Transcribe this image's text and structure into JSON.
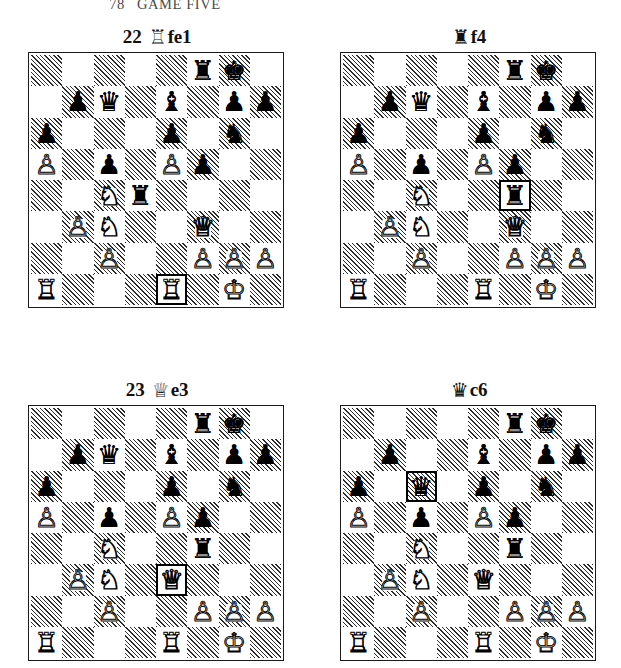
{
  "running_head": {
    "folio": "78",
    "title": "GAME FIVE"
  },
  "glyphs": {
    "white_king": "♔",
    "white_queen": "♕",
    "white_rook": "♖",
    "white_bishop": "♗",
    "white_knight": "♘",
    "white_pawn": "♙",
    "black_king": "♚",
    "black_queen": "♛",
    "black_rook": "♜",
    "black_bishop": "♝",
    "black_knight": "♞",
    "black_pawn": "♟"
  },
  "colors": {
    "ink": "#111111",
    "board_border": "#1a1a1a",
    "hatch": "#2b2b2b",
    "highlight": "#000000",
    "page": "#ffffff"
  },
  "diagrams": [
    {
      "id": "diagram-1",
      "position_label": "top-left",
      "caption": {
        "move_number": "22",
        "piece_glyph": "♖",
        "piece_name": "white-rook",
        "san": "fe1",
        "full": "22 ♖fe1"
      },
      "highlight_square": "e1",
      "pieces": [
        {
          "square": "f8",
          "piece": "black-rook",
          "glyph": "♜",
          "side": "b"
        },
        {
          "square": "g8",
          "piece": "black-king",
          "glyph": "♚",
          "side": "b"
        },
        {
          "square": "b7",
          "piece": "black-pawn",
          "glyph": "♟",
          "side": "b"
        },
        {
          "square": "c7",
          "piece": "black-queen",
          "glyph": "♛",
          "side": "b"
        },
        {
          "square": "e7",
          "piece": "black-bishop",
          "glyph": "♝",
          "side": "b"
        },
        {
          "square": "g7",
          "piece": "black-pawn",
          "glyph": "♟",
          "side": "b"
        },
        {
          "square": "h7",
          "piece": "black-pawn",
          "glyph": "♟",
          "side": "b"
        },
        {
          "square": "a6",
          "piece": "black-pawn",
          "glyph": "♟",
          "side": "b"
        },
        {
          "square": "e6",
          "piece": "black-pawn",
          "glyph": "♟",
          "side": "b"
        },
        {
          "square": "g6",
          "piece": "black-knight",
          "glyph": "♞",
          "side": "b"
        },
        {
          "square": "a5",
          "piece": "white-pawn",
          "glyph": "♙",
          "side": "w"
        },
        {
          "square": "c5",
          "piece": "black-pawn",
          "glyph": "♟",
          "side": "b"
        },
        {
          "square": "e5",
          "piece": "white-pawn",
          "glyph": "♙",
          "side": "w"
        },
        {
          "square": "f5",
          "piece": "black-pawn",
          "glyph": "♟",
          "side": "b"
        },
        {
          "square": "c4",
          "piece": "white-knight",
          "glyph": "♘",
          "side": "w"
        },
        {
          "square": "d4",
          "piece": "black-rook",
          "glyph": "♜",
          "side": "b"
        },
        {
          "square": "b3",
          "piece": "white-pawn",
          "glyph": "♙",
          "side": "w"
        },
        {
          "square": "c3",
          "piece": "white-knight",
          "glyph": "♘",
          "side": "w"
        },
        {
          "square": "f3",
          "piece": "white-queen",
          "glyph": "♕",
          "side": "w"
        },
        {
          "square": "c2",
          "piece": "white-pawn",
          "glyph": "♙",
          "side": "w"
        },
        {
          "square": "f2",
          "piece": "white-pawn",
          "glyph": "♙",
          "side": "w"
        },
        {
          "square": "g2",
          "piece": "white-pawn",
          "glyph": "♙",
          "side": "w"
        },
        {
          "square": "h2",
          "piece": "white-pawn",
          "glyph": "♙",
          "side": "w"
        },
        {
          "square": "a1",
          "piece": "white-rook",
          "glyph": "♖",
          "side": "w"
        },
        {
          "square": "e1",
          "piece": "white-rook",
          "glyph": "♖",
          "side": "w"
        },
        {
          "square": "g1",
          "piece": "white-king",
          "glyph": "♔",
          "side": "w"
        }
      ]
    },
    {
      "id": "diagram-2",
      "position_label": "top-right",
      "caption": {
        "move_number": "",
        "piece_glyph": "♜",
        "piece_name": "black-rook",
        "san": "f4",
        "full": "♜f4"
      },
      "highlight_square": "f4",
      "pieces": [
        {
          "square": "f8",
          "piece": "black-rook",
          "glyph": "♜",
          "side": "b"
        },
        {
          "square": "g8",
          "piece": "black-king",
          "glyph": "♚",
          "side": "b"
        },
        {
          "square": "b7",
          "piece": "black-pawn",
          "glyph": "♟",
          "side": "b"
        },
        {
          "square": "c7",
          "piece": "black-queen",
          "glyph": "♛",
          "side": "b"
        },
        {
          "square": "e7",
          "piece": "black-bishop",
          "glyph": "♝",
          "side": "b"
        },
        {
          "square": "g7",
          "piece": "black-pawn",
          "glyph": "♟",
          "side": "b"
        },
        {
          "square": "h7",
          "piece": "black-pawn",
          "glyph": "♟",
          "side": "b"
        },
        {
          "square": "a6",
          "piece": "black-pawn",
          "glyph": "♟",
          "side": "b"
        },
        {
          "square": "e6",
          "piece": "black-pawn",
          "glyph": "♟",
          "side": "b"
        },
        {
          "square": "g6",
          "piece": "black-knight",
          "glyph": "♞",
          "side": "b"
        },
        {
          "square": "a5",
          "piece": "white-pawn",
          "glyph": "♙",
          "side": "w"
        },
        {
          "square": "c5",
          "piece": "black-pawn",
          "glyph": "♟",
          "side": "b"
        },
        {
          "square": "e5",
          "piece": "white-pawn",
          "glyph": "♙",
          "side": "w"
        },
        {
          "square": "f5",
          "piece": "black-pawn",
          "glyph": "♟",
          "side": "b"
        },
        {
          "square": "c4",
          "piece": "white-knight",
          "glyph": "♘",
          "side": "w"
        },
        {
          "square": "f4",
          "piece": "black-rook",
          "glyph": "♜",
          "side": "b"
        },
        {
          "square": "b3",
          "piece": "white-pawn",
          "glyph": "♙",
          "side": "w"
        },
        {
          "square": "c3",
          "piece": "white-knight",
          "glyph": "♘",
          "side": "w"
        },
        {
          "square": "f3",
          "piece": "white-queen",
          "glyph": "♕",
          "side": "w"
        },
        {
          "square": "c2",
          "piece": "white-pawn",
          "glyph": "♙",
          "side": "w"
        },
        {
          "square": "f2",
          "piece": "white-pawn",
          "glyph": "♙",
          "side": "w"
        },
        {
          "square": "g2",
          "piece": "white-pawn",
          "glyph": "♙",
          "side": "w"
        },
        {
          "square": "h2",
          "piece": "white-pawn",
          "glyph": "♙",
          "side": "w"
        },
        {
          "square": "a1",
          "piece": "white-rook",
          "glyph": "♖",
          "side": "w"
        },
        {
          "square": "e1",
          "piece": "white-rook",
          "glyph": "♖",
          "side": "w"
        },
        {
          "square": "g1",
          "piece": "white-king",
          "glyph": "♔",
          "side": "w"
        }
      ]
    },
    {
      "id": "diagram-3",
      "position_label": "bottom-left",
      "caption": {
        "move_number": "23",
        "piece_glyph": "♕",
        "piece_name": "white-queen",
        "san": "e3",
        "full": "23 ♕e3"
      },
      "highlight_square": "e3",
      "pieces": [
        {
          "square": "f8",
          "piece": "black-rook",
          "glyph": "♜",
          "side": "b"
        },
        {
          "square": "g8",
          "piece": "black-king",
          "glyph": "♚",
          "side": "b"
        },
        {
          "square": "b7",
          "piece": "black-pawn",
          "glyph": "♟",
          "side": "b"
        },
        {
          "square": "c7",
          "piece": "black-queen",
          "glyph": "♛",
          "side": "b"
        },
        {
          "square": "e7",
          "piece": "black-bishop",
          "glyph": "♝",
          "side": "b"
        },
        {
          "square": "g7",
          "piece": "black-pawn",
          "glyph": "♟",
          "side": "b"
        },
        {
          "square": "h7",
          "piece": "black-pawn",
          "glyph": "♟",
          "side": "b"
        },
        {
          "square": "a6",
          "piece": "black-pawn",
          "glyph": "♟",
          "side": "b"
        },
        {
          "square": "e6",
          "piece": "black-pawn",
          "glyph": "♟",
          "side": "b"
        },
        {
          "square": "g6",
          "piece": "black-knight",
          "glyph": "♞",
          "side": "b"
        },
        {
          "square": "a5",
          "piece": "white-pawn",
          "glyph": "♙",
          "side": "w"
        },
        {
          "square": "c5",
          "piece": "black-pawn",
          "glyph": "♟",
          "side": "b"
        },
        {
          "square": "e5",
          "piece": "white-pawn",
          "glyph": "♙",
          "side": "w"
        },
        {
          "square": "f5",
          "piece": "black-pawn",
          "glyph": "♟",
          "side": "b"
        },
        {
          "square": "c4",
          "piece": "white-knight",
          "glyph": "♘",
          "side": "w"
        },
        {
          "square": "f4",
          "piece": "black-rook",
          "glyph": "♜",
          "side": "b"
        },
        {
          "square": "b3",
          "piece": "white-pawn",
          "glyph": "♙",
          "side": "w"
        },
        {
          "square": "c3",
          "piece": "white-knight",
          "glyph": "♘",
          "side": "w"
        },
        {
          "square": "e3",
          "piece": "white-queen",
          "glyph": "♕",
          "side": "w"
        },
        {
          "square": "c2",
          "piece": "white-pawn",
          "glyph": "♙",
          "side": "w"
        },
        {
          "square": "f2",
          "piece": "white-pawn",
          "glyph": "♙",
          "side": "w"
        },
        {
          "square": "g2",
          "piece": "white-pawn",
          "glyph": "♙",
          "side": "w"
        },
        {
          "square": "h2",
          "piece": "white-pawn",
          "glyph": "♙",
          "side": "w"
        },
        {
          "square": "a1",
          "piece": "white-rook",
          "glyph": "♖",
          "side": "w"
        },
        {
          "square": "e1",
          "piece": "white-rook",
          "glyph": "♖",
          "side": "w"
        },
        {
          "square": "g1",
          "piece": "white-king",
          "glyph": "♔",
          "side": "w"
        }
      ]
    },
    {
      "id": "diagram-4",
      "position_label": "bottom-right",
      "caption": {
        "move_number": "",
        "piece_glyph": "♛",
        "piece_name": "black-queen",
        "san": "c6",
        "full": "♛c6"
      },
      "highlight_square": "c6",
      "pieces": [
        {
          "square": "f8",
          "piece": "black-rook",
          "glyph": "♜",
          "side": "b"
        },
        {
          "square": "g8",
          "piece": "black-king",
          "glyph": "♚",
          "side": "b"
        },
        {
          "square": "b7",
          "piece": "black-pawn",
          "glyph": "♟",
          "side": "b"
        },
        {
          "square": "e7",
          "piece": "black-bishop",
          "glyph": "♝",
          "side": "b"
        },
        {
          "square": "g7",
          "piece": "black-pawn",
          "glyph": "♟",
          "side": "b"
        },
        {
          "square": "h7",
          "piece": "black-pawn",
          "glyph": "♟",
          "side": "b"
        },
        {
          "square": "a6",
          "piece": "black-pawn",
          "glyph": "♟",
          "side": "b"
        },
        {
          "square": "c6",
          "piece": "black-queen",
          "glyph": "♛",
          "side": "b"
        },
        {
          "square": "e6",
          "piece": "black-pawn",
          "glyph": "♟",
          "side": "b"
        },
        {
          "square": "g6",
          "piece": "black-knight",
          "glyph": "♞",
          "side": "b"
        },
        {
          "square": "a5",
          "piece": "white-pawn",
          "glyph": "♙",
          "side": "w"
        },
        {
          "square": "c5",
          "piece": "black-pawn",
          "glyph": "♟",
          "side": "b"
        },
        {
          "square": "e5",
          "piece": "white-pawn",
          "glyph": "♙",
          "side": "w"
        },
        {
          "square": "f5",
          "piece": "black-pawn",
          "glyph": "♟",
          "side": "b"
        },
        {
          "square": "c4",
          "piece": "white-knight",
          "glyph": "♘",
          "side": "w"
        },
        {
          "square": "f4",
          "piece": "black-rook",
          "glyph": "♜",
          "side": "b"
        },
        {
          "square": "b3",
          "piece": "white-pawn",
          "glyph": "♙",
          "side": "w"
        },
        {
          "square": "c3",
          "piece": "white-knight",
          "glyph": "♘",
          "side": "w"
        },
        {
          "square": "e3",
          "piece": "white-queen",
          "glyph": "♕",
          "side": "w"
        },
        {
          "square": "c2",
          "piece": "white-pawn",
          "glyph": "♙",
          "side": "w"
        },
        {
          "square": "f2",
          "piece": "white-pawn",
          "glyph": "♙",
          "side": "w"
        },
        {
          "square": "g2",
          "piece": "white-pawn",
          "glyph": "♙",
          "side": "w"
        },
        {
          "square": "h2",
          "piece": "white-pawn",
          "glyph": "♙",
          "side": "w"
        },
        {
          "square": "a1",
          "piece": "white-rook",
          "glyph": "♖",
          "side": "w"
        },
        {
          "square": "e1",
          "piece": "white-rook",
          "glyph": "♖",
          "side": "w"
        },
        {
          "square": "g1",
          "piece": "white-king",
          "glyph": "♔",
          "side": "w"
        }
      ]
    }
  ]
}
